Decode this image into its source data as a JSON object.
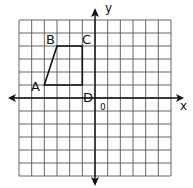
{
  "chart_data": {
    "type": "diagram",
    "title": "",
    "xlabel": "x",
    "ylabel": "y",
    "origin_label": "0",
    "grid": true,
    "xlim": [
      -6,
      6
    ],
    "ylim": [
      -6,
      6
    ],
    "shape": {
      "kind": "quadrilateral",
      "vertices": [
        {
          "label": "A",
          "x": -4,
          "y": 1
        },
        {
          "label": "B",
          "x": -3,
          "y": 4
        },
        {
          "label": "C",
          "x": -1,
          "y": 4
        },
        {
          "label": "D",
          "x": -1,
          "y": 1
        }
      ]
    }
  },
  "labels": {
    "x_axis": "x",
    "y_axis": "y",
    "origin": "0",
    "A": "A",
    "B": "B",
    "C": "C",
    "D": "D"
  },
  "colors": {
    "grid": "#555555",
    "axis": "#111111",
    "shape": "#111111",
    "background": "#ffffff"
  }
}
